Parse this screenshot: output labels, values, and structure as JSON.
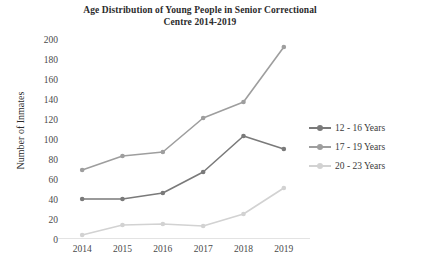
{
  "chart_data": {
    "type": "line",
    "title": "Age Distribution of Young People in Senior Correctional Centre 2014-2019",
    "title_line1": "Age Distribution of Young People in Senior Correctional",
    "title_line2": "Centre 2014-2019",
    "xlabel": "",
    "ylabel": "Number of Inmates",
    "categories": [
      "2014",
      "2015",
      "2016",
      "2017",
      "2018",
      "2019"
    ],
    "ylim": [
      0,
      200
    ],
    "ytick_values": [
      200,
      180,
      160,
      140,
      120,
      100,
      80,
      60,
      40,
      20,
      0
    ],
    "grid": false,
    "legend_position": "right",
    "series": [
      {
        "name": "12 - 16 Years",
        "color": "#7a7a7a",
        "values": [
          41,
          41,
          47,
          68,
          104,
          91
        ]
      },
      {
        "name": "17 - 19 Years",
        "color": "#9e9e9e",
        "values": [
          70,
          84,
          88,
          122,
          138,
          193
        ]
      },
      {
        "name": "20 - 23 Years",
        "color": "#d2d2d2",
        "values": [
          5,
          15,
          16,
          14,
          26,
          52
        ]
      }
    ]
  },
  "colors": {
    "series_dark": "#7a7a7a",
    "series_medium": "#9e9e9e",
    "series_light": "#d2d2d2",
    "axis": "#e3e3e3",
    "text": "#3a3a3a",
    "background": "#ffffff"
  }
}
